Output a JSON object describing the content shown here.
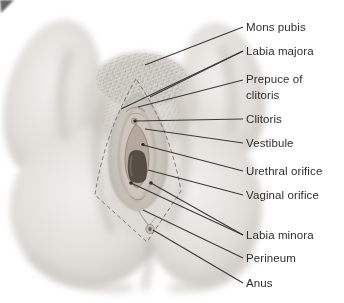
{
  "annotations": {
    "labels": [
      {
        "name": "mons-pubis",
        "text": "Mons pubis"
      },
      {
        "name": "labia-majora",
        "text": "Labia majora"
      },
      {
        "name": "prepuce",
        "text": "Prepuce of clitoris"
      },
      {
        "name": "clitoris",
        "text": "Clitoris"
      },
      {
        "name": "vestibule",
        "text": "Vestibule"
      },
      {
        "name": "urethral-orifice",
        "text": "Urethral orifice"
      },
      {
        "name": "vaginal-orifice",
        "text": "Vaginal orifice"
      },
      {
        "name": "labia-minora",
        "text": "Labia minora"
      },
      {
        "name": "perineum",
        "text": "Perineum"
      },
      {
        "name": "anus",
        "text": "Anus"
      }
    ]
  },
  "colors": {
    "label_text": "#2e2e2e",
    "leader_line": "#3a3a3a",
    "dashed_outline": "#787878",
    "skin_light": "#efede9",
    "skin_shadow": "#c6c1bb",
    "orifice_dark": "#564e45"
  }
}
